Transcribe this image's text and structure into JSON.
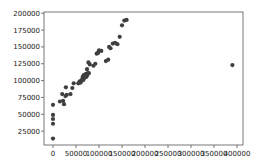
{
  "chart_data": {
    "type": "scatter",
    "title": "",
    "xlabel": "",
    "ylabel": "",
    "xlim": [
      -20000,
      410000
    ],
    "ylim": [
      5000,
      200000
    ],
    "grid": false,
    "legend": null,
    "xticks": [
      0,
      50000,
      100000,
      150000,
      200000,
      250000,
      300000,
      350000,
      400000
    ],
    "xtick_labels": [
      "0",
      "50000",
      "100000",
      "150000",
      "200000",
      "250000",
      "300000",
      "350000",
      "400000"
    ],
    "yticks": [
      25000,
      50000,
      75000,
      100000,
      125000,
      150000,
      175000,
      200000
    ],
    "ytick_labels": [
      "25000",
      "50000",
      "75000",
      "100000",
      "125000",
      "150000",
      "175000",
      "200000"
    ],
    "point_color": "#3f3f3f",
    "series": [
      {
        "name": "data",
        "x": [
          0,
          0,
          0,
          0,
          0,
          15000,
          20000,
          22000,
          24000,
          27000,
          28000,
          30000,
          38000,
          42000,
          45000,
          55000,
          58000,
          60000,
          62000,
          64000,
          65000,
          66000,
          67000,
          68000,
          69000,
          70000,
          71000,
          72000,
          73000,
          74000,
          75000,
          76000,
          77000,
          78000,
          80000,
          88000,
          92000,
          95000,
          98000,
          100000,
          105000,
          115000,
          120000,
          122000,
          125000,
          130000,
          135000,
          140000,
          145000,
          150000,
          155000,
          160000,
          390000
        ],
        "y": [
          14000,
          36000,
          43000,
          49000,
          64000,
          69000,
          80000,
          70000,
          65000,
          77000,
          90000,
          79000,
          80000,
          89000,
          96000,
          96000,
          99000,
          97000,
          100000,
          103000,
          106000,
          101000,
          108000,
          104000,
          107000,
          109000,
          105000,
          110000,
          106000,
          117000,
          109000,
          111000,
          127000,
          111000,
          124000,
          122000,
          125000,
          140000,
          141000,
          145000,
          144000,
          129000,
          131000,
          150000,
          148000,
          155000,
          156000,
          154000,
          165000,
          182000,
          189000,
          190000,
          123000
        ]
      }
    ]
  }
}
